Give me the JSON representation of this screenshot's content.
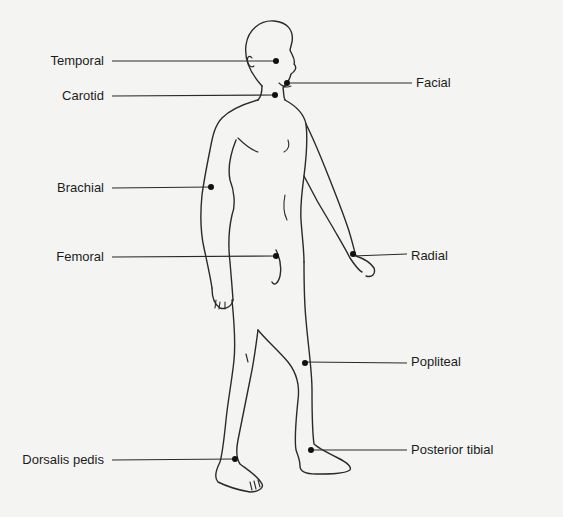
{
  "diagram": {
    "style": {
      "line_color": "#2a2a2a",
      "background": "#f4f4f2",
      "text_color": "#1c1c1c"
    },
    "labels": [
      {
        "id": "temporal",
        "text": "Temporal",
        "side": "left",
        "label_x": 110,
        "y": 61,
        "dot": [
          276,
          61
        ]
      },
      {
        "id": "carotid",
        "text": "Carotid",
        "side": "left",
        "label_x": 110,
        "y": 96,
        "dot": [
          275,
          95
        ]
      },
      {
        "id": "brachial",
        "text": "Brachial",
        "side": "left",
        "label_x": 110,
        "y": 188,
        "dot": [
          211,
          187
        ]
      },
      {
        "id": "femoral",
        "text": "Femoral",
        "side": "left",
        "label_x": 110,
        "y": 257,
        "dot": [
          276,
          256
        ]
      },
      {
        "id": "dorsalis-pedis",
        "text": "Dorsalis pedis",
        "side": "left",
        "label_x": 110,
        "y": 460,
        "dot": [
          235,
          459
        ]
      },
      {
        "id": "facial",
        "text": "Facial",
        "side": "right",
        "label_x": 410,
        "y": 83,
        "dot": [
          287,
          83
        ]
      },
      {
        "id": "radial",
        "text": "Radial",
        "side": "right",
        "label_x": 405,
        "y": 256,
        "dot": [
          353,
          254
        ]
      },
      {
        "id": "popliteal",
        "text": "Popliteal",
        "side": "right",
        "label_x": 405,
        "y": 362,
        "dot": [
          305,
          363
        ]
      },
      {
        "id": "posterior-tibial",
        "text": "Posterior tibial",
        "side": "right",
        "label_x": 405,
        "y": 450,
        "dot": [
          311,
          450
        ]
      }
    ]
  }
}
